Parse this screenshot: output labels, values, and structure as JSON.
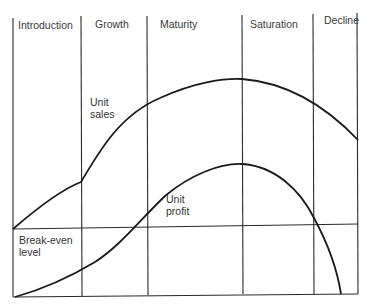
{
  "diagram": {
    "stages": [
      {
        "label": "Introduction"
      },
      {
        "label": "Growth"
      },
      {
        "label": "Maturity"
      },
      {
        "label": "Saturation"
      },
      {
        "label": "Decline"
      }
    ],
    "curves": {
      "unit_sales": {
        "label_line1": "Unit",
        "label_line2": "sales"
      },
      "unit_profit": {
        "label_line1": "Unit",
        "label_line2": "profit"
      }
    },
    "break_even": {
      "label_line1": "Break-even",
      "label_line2": "level"
    },
    "colors": {
      "line": "#1a1a1a",
      "grid": "#2a2a2a",
      "text": "#333333",
      "background": "#ffffff"
    }
  }
}
